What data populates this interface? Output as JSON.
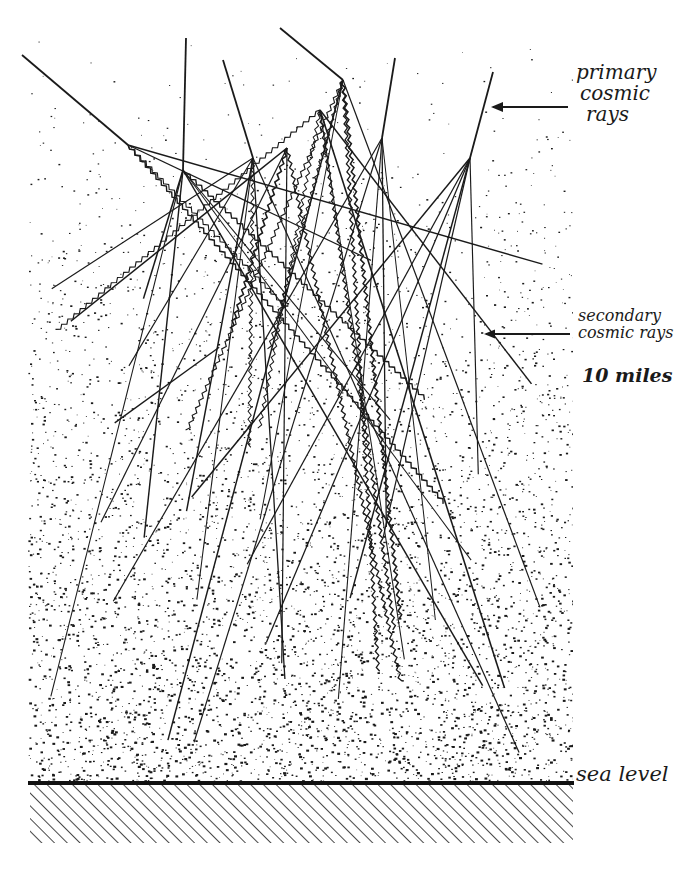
{
  "figure": {
    "colors": {
      "ink": "#1a1a1a",
      "paper": "#ffffff"
    }
  },
  "labels": {
    "primary": {
      "line1": "primary",
      "line2": "cosmic",
      "line3": "rays"
    },
    "secondary": {
      "line1": "secondary",
      "line2": "cosmic rays"
    },
    "altitude": "10 miles",
    "sea_level": "sea level"
  },
  "symbols": {
    "charge_marker": "+",
    "primary_count": 6
  }
}
